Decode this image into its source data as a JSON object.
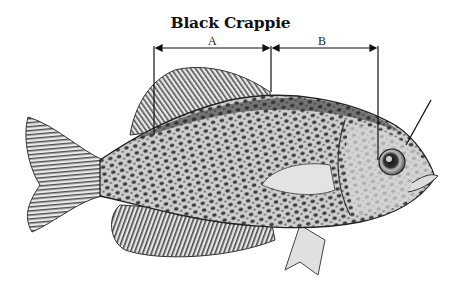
{
  "title": "Black Crappie",
  "measurements": [
    {
      "label": "A",
      "description": "Dorsal fin base length"
    },
    {
      "label": "B",
      "description": "Distance from dorsal fin origin to eye"
    }
  ],
  "colors": {
    "ink": "#111111",
    "body_light": "#d8d8d8",
    "body_dark": "#3a3a3a",
    "background": "#ffffff"
  }
}
